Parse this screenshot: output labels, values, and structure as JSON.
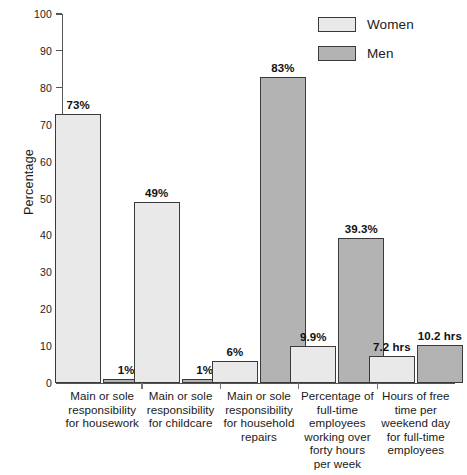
{
  "chart_data": {
    "type": "bar",
    "title": "",
    "subtitle": "",
    "xlabel": "",
    "ylabel": "Percentage",
    "ylim": [
      0,
      100
    ],
    "yticks": [
      0,
      10,
      20,
      30,
      40,
      50,
      60,
      70,
      80,
      90,
      100
    ],
    "grid": false,
    "legend_position": "top-right",
    "categories": [
      "Main or sole responsibility for housework",
      "Main or sole responsibility for childcare",
      "Main or sole responsibility for household repairs",
      "Percentage of full-time employees working over forty hours per week",
      "Hours of free time per weekend day for full-time employees"
    ],
    "category_lines": [
      [
        "Main or sole",
        "responsibility",
        "for housework"
      ],
      [
        "Main or sole",
        "responsibility",
        "for childcare"
      ],
      [
        "Main or sole",
        "responsibility",
        "for household",
        "repairs"
      ],
      [
        "Percentage of",
        "full-time",
        "employees",
        "working over",
        "forty hours",
        "per week"
      ],
      [
        "Hours of free",
        "time per",
        "weekend day",
        "for full-time",
        "employees"
      ]
    ],
    "series": [
      {
        "name": "Women",
        "color": "#e9e9e9",
        "values": [
          73,
          49,
          6,
          9.9,
          7.2
        ],
        "labels": [
          "73%",
          "49%",
          "6%",
          "9.9%",
          "7.2 hrs"
        ]
      },
      {
        "name": "Men",
        "color": "#b3b3b3",
        "values": [
          1,
          1,
          83,
          39.3,
          10.2
        ],
        "labels": [
          "1%",
          "1%",
          "83%",
          "39.3%",
          "10.2 hrs"
        ]
      }
    ]
  },
  "legend": {
    "items": [
      {
        "label": "Women",
        "color": "#e9e9e9"
      },
      {
        "label": "Men",
        "color": "#b3b3b3"
      }
    ]
  },
  "axes": {
    "y_title": "Percentage",
    "y_tick_labels": [
      "100",
      "90",
      "80",
      "70",
      "60",
      "50",
      "40",
      "30",
      "20",
      "10",
      "0"
    ]
  }
}
